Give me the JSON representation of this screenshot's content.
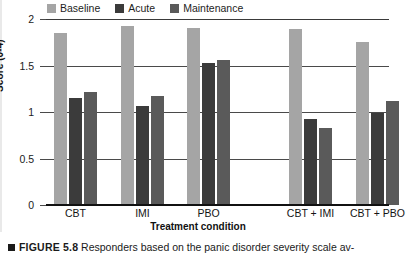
{
  "figure": {
    "caption_marker": "square-bullet",
    "caption_number": "FIGURE 5.8",
    "caption_text": "Responders based on the panic disorder severity scale av-"
  },
  "legend": {
    "position": "top-left",
    "items": [
      {
        "label": "Baseline",
        "color": "#a5a5a5",
        "name": "legend-baseline"
      },
      {
        "label": "Acute",
        "color": "#3b3b3b",
        "name": "legend-acute"
      },
      {
        "label": "Maintenance",
        "color": "#5a5a5a",
        "name": "legend-maintenance"
      }
    ]
  },
  "axes": {
    "ylabel": "Score (0-4)",
    "xlabel": "Treatment condition",
    "yticks": [
      "0",
      "0.5",
      "1",
      "1.5",
      "2"
    ],
    "ymin": 0,
    "ymax": 2
  },
  "chart_data": {
    "type": "bar",
    "title": "",
    "subtitle": "",
    "xlabel": "Treatment condition",
    "ylabel": "Score (0-4)",
    "ylim": [
      0,
      2
    ],
    "yticks": [
      0,
      0.5,
      1,
      1.5,
      2
    ],
    "grid": true,
    "legend_position": "top-left",
    "categories": [
      "CBT",
      "IMI",
      "PBO",
      "CBT + IMI",
      "CBT + PBO"
    ],
    "group_gap_after": "PBO",
    "series": [
      {
        "name": "Baseline",
        "color": "#a5a5a5",
        "values": [
          1.85,
          1.92,
          1.9,
          1.89,
          1.75
        ]
      },
      {
        "name": "Acute",
        "color": "#3b3b3b",
        "values": [
          1.15,
          1.07,
          1.53,
          0.93,
          0.99
        ]
      },
      {
        "name": "Maintenance",
        "color": "#5a5a5a",
        "values": [
          1.21,
          1.17,
          1.56,
          0.83,
          1.12
        ]
      }
    ]
  }
}
